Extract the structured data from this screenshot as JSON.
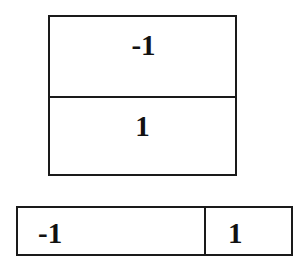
{
  "diagrams": [
    {
      "orientation": "vertical",
      "cells": [
        {
          "label": "-1"
        },
        {
          "label": "1"
        }
      ]
    },
    {
      "orientation": "horizontal",
      "cells": [
        {
          "label": "-1"
        },
        {
          "label": "1"
        }
      ]
    }
  ]
}
